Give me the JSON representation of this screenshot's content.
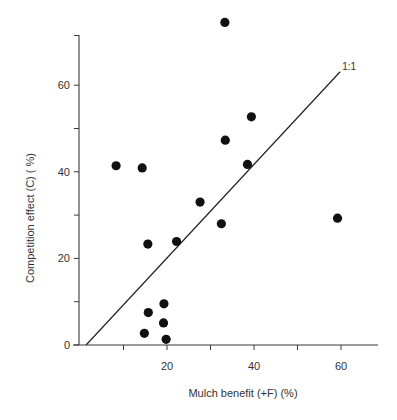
{
  "chart_data": {
    "type": "scatter",
    "title": "",
    "xlabel": "Mulch benefit (+F) (%)",
    "ylabel": "Competition effect (C) ( %)",
    "xlim": [
      0,
      69
    ],
    "ylim": [
      0,
      70
    ],
    "x_ticks": [
      10,
      20,
      30,
      40,
      50,
      60
    ],
    "x_tick_labels": [
      {
        "value": 20,
        "label": "20"
      },
      {
        "value": 40,
        "label": "40"
      },
      {
        "value": 60,
        "label": "60"
      }
    ],
    "y_ticks": [
      0,
      10,
      20,
      30,
      40,
      50,
      60
    ],
    "y_tick_labels": [
      {
        "value": 0,
        "label": "0"
      },
      {
        "value": 20,
        "label": "20"
      },
      {
        "value": 40,
        "label": "40"
      },
      {
        "value": 60,
        "label": "60"
      }
    ],
    "grid": false,
    "legend": null,
    "series": [
      {
        "name": "observations",
        "points": [
          {
            "x": 8.3,
            "y": 41.4
          },
          {
            "x": 14.3,
            "y": 40.9
          },
          {
            "x": 15.6,
            "y": 23.3
          },
          {
            "x": 22.2,
            "y": 23.9
          },
          {
            "x": 15.7,
            "y": 7.5
          },
          {
            "x": 19.3,
            "y": 9.5
          },
          {
            "x": 19.2,
            "y": 5.1
          },
          {
            "x": 14.8,
            "y": 2.7
          },
          {
            "x": 19.8,
            "y": 1.3
          },
          {
            "x": 33.3,
            "y": 74.5
          },
          {
            "x": 39.4,
            "y": 52.7
          },
          {
            "x": 33.4,
            "y": 47.3
          },
          {
            "x": 38.5,
            "y": 41.7
          },
          {
            "x": 27.6,
            "y": 33.0
          },
          {
            "x": 32.5,
            "y": 28.0
          },
          {
            "x": 59.2,
            "y": 29.3
          }
        ]
      }
    ],
    "reference_line": {
      "label": "1:1",
      "from": {
        "x": 1.4,
        "y": 0
      },
      "to": {
        "x": 59.8,
        "y": 63.1
      }
    }
  }
}
